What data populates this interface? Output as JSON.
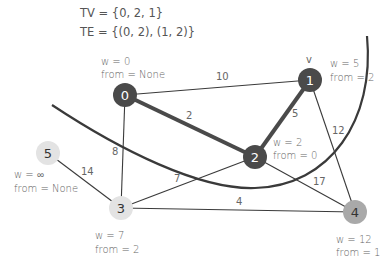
{
  "header": {
    "tv_line": "TV = {0, 2, 1}",
    "te_line": "TE = {(0, 2), (1, 2)}"
  },
  "colors": {
    "tree_node": "#4a4a4a",
    "frontier_node": "#e3e3e3",
    "special_node": "#a9a9a9",
    "edge": "#3a3a3a",
    "cut_curve": "#3a3a3a",
    "text": "#666666"
  },
  "current_marker": "v",
  "nodes": [
    {
      "id": "0",
      "w": "w = 0",
      "from": "from = None"
    },
    {
      "id": "1",
      "w": "w = 5",
      "from": "from = 2"
    },
    {
      "id": "2",
      "w": "w = 2",
      "from": "from = 0"
    },
    {
      "id": "3",
      "w": "w = 7",
      "from": "from = 2"
    },
    {
      "id": "4",
      "w": "w = 12",
      "from": "from = 1"
    },
    {
      "id": "5",
      "w": "w = ∞",
      "from": "from = None"
    }
  ],
  "edges": [
    {
      "u": "0",
      "v": "1",
      "weight": "10",
      "tree": false
    },
    {
      "u": "0",
      "v": "2",
      "weight": "2",
      "tree": true
    },
    {
      "u": "1",
      "v": "2",
      "weight": "5",
      "tree": true
    },
    {
      "u": "0",
      "v": "3",
      "weight": "8",
      "tree": false
    },
    {
      "u": "1",
      "v": "4",
      "weight": "12",
      "tree": false
    },
    {
      "u": "2",
      "v": "3",
      "weight": "7",
      "tree": false
    },
    {
      "u": "2",
      "v": "4",
      "weight": "17",
      "tree": false
    },
    {
      "u": "3",
      "v": "4",
      "weight": "4",
      "tree": false
    },
    {
      "u": "5",
      "v": "3",
      "weight": "14",
      "tree": false
    }
  ]
}
